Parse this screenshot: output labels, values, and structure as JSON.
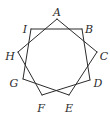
{
  "diagram": {
    "type": "star-polygon",
    "stroke_color": "#2b2b2b",
    "background": "#ffffff",
    "vertices": [
      {
        "id": "A",
        "x": 57,
        "y": 19,
        "label": "A",
        "lx": 57,
        "ly": 13
      },
      {
        "id": "B",
        "x": 82,
        "y": 29,
        "label": "B",
        "lx": 89,
        "ly": 30
      },
      {
        "id": "C",
        "x": 97,
        "y": 52,
        "label": "C",
        "lx": 104,
        "ly": 57
      },
      {
        "id": "D",
        "x": 90,
        "y": 80,
        "label": "D",
        "lx": 98,
        "ly": 84
      },
      {
        "id": "E",
        "x": 69,
        "y": 95,
        "label": "E",
        "lx": 69,
        "ly": 109
      },
      {
        "id": "F",
        "x": 42,
        "y": 95,
        "label": "F",
        "lx": 41,
        "ly": 109
      },
      {
        "id": "G",
        "x": 23,
        "y": 79,
        "label": "G",
        "lx": 14,
        "ly": 84
      },
      {
        "id": "H",
        "x": 18,
        "y": 52,
        "label": "H",
        "lx": 10,
        "ly": 57
      },
      {
        "id": "I",
        "x": 31,
        "y": 29,
        "label": "I",
        "lx": 25,
        "ly": 30
      }
    ],
    "edges": [
      [
        "A",
        "C"
      ],
      [
        "C",
        "E"
      ],
      [
        "E",
        "G"
      ],
      [
        "G",
        "I"
      ],
      [
        "I",
        "B"
      ],
      [
        "B",
        "D"
      ],
      [
        "D",
        "F"
      ],
      [
        "F",
        "H"
      ],
      [
        "H",
        "A"
      ]
    ]
  }
}
